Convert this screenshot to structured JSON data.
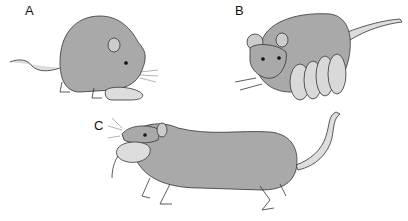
{
  "figure": {
    "panels": [
      {
        "label": "A",
        "description": "Rat retrieving a pup"
      },
      {
        "label": "B",
        "description": "Rat nursing a litter of pups"
      },
      {
        "label": "C",
        "description": "Rat carrying a pup in its mouth"
      }
    ],
    "colors": {
      "body": "#a9a9a9",
      "light": "#d9d9d9",
      "outline": "#333333"
    }
  }
}
